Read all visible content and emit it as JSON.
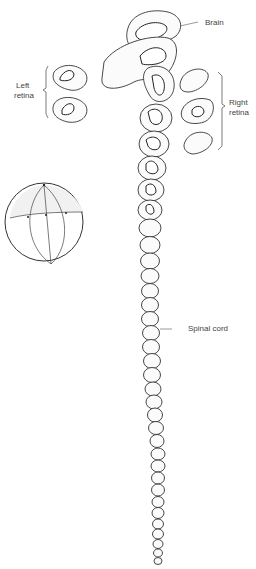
{
  "diagram": {
    "type": "embryo serial sections (line drawing)",
    "labels": {
      "brain": "Brain",
      "left_retina": "Left\nretina",
      "left_retina_line1": "Left",
      "left_retina_line2": "retina",
      "right_retina_line1": "Right",
      "right_retina_line2": "retina",
      "spinal_cord": "Spinal cord"
    },
    "components": [
      {
        "name": "brain",
        "region": "top sections"
      },
      {
        "name": "left-retina",
        "region": "two sections at upper left"
      },
      {
        "name": "right-retina",
        "region": "sections at upper right"
      },
      {
        "name": "spinal-cord",
        "region": "tapering chain of sections"
      },
      {
        "name": "embryo-sphere",
        "region": "sphere with section lines, left"
      }
    ],
    "colors": {
      "line": "#333333",
      "background": "#ffffff",
      "fill": "#fbfbfb"
    }
  }
}
